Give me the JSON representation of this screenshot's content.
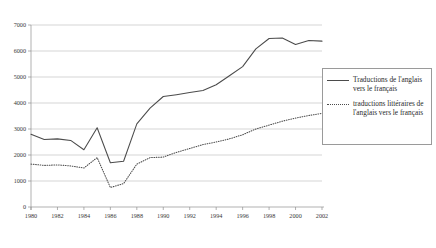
{
  "chart_data": {
    "type": "line",
    "title": "",
    "subtitle": "",
    "xlabel": "",
    "ylabel": "",
    "xlim": [
      1980,
      2002
    ],
    "ylim": [
      0,
      7000
    ],
    "grid": true,
    "legend_position": "right",
    "y_ticks": [
      0,
      1000,
      2000,
      3000,
      4000,
      5000,
      6000,
      7000
    ],
    "y_tick_labels": [
      "0",
      "1000",
      "2000",
      "3000",
      "4000",
      "5000",
      "6000",
      "7000"
    ],
    "x_ticks": [
      1980,
      1982,
      1984,
      1986,
      1988,
      1990,
      1992,
      1994,
      1996,
      1998,
      2000,
      2002
    ],
    "x_tick_labels": [
      "1980",
      "1982",
      "1984",
      "1986",
      "1988",
      "1990",
      "1992",
      "1994",
      "1996",
      "1998",
      "2000",
      "2002"
    ],
    "x": [
      1980,
      1981,
      1982,
      1983,
      1984,
      1985,
      1986,
      1987,
      1988,
      1989,
      1990,
      1991,
      1992,
      1993,
      1994,
      1995,
      1996,
      1997,
      1998,
      1999,
      2000,
      2001,
      2002
    ],
    "series": [
      {
        "name": "Traductions de l'anglais vers le français",
        "style": "solid",
        "color": "#4b4b4b",
        "values": [
          2800,
          2600,
          2620,
          2560,
          2200,
          3050,
          1700,
          1760,
          3200,
          3800,
          4250,
          4320,
          4400,
          4480,
          4700,
          5050,
          5400,
          6080,
          6480,
          6500,
          6250,
          6400,
          6380
        ]
      },
      {
        "name": "traductions littéraires de l'anglais vers le français",
        "style": "dotted",
        "color": "#4b4b4b",
        "values": [
          1650,
          1600,
          1620,
          1580,
          1500,
          1900,
          750,
          900,
          1650,
          1900,
          1920,
          2100,
          2250,
          2400,
          2500,
          2620,
          2780,
          3000,
          3150,
          3300,
          3420,
          3520,
          3600
        ]
      }
    ]
  },
  "legend": {
    "entries": [
      {
        "label": "Traductions de l'anglais vers le français",
        "style": "solid"
      },
      {
        "label": "traductions littéraires de l'anglais vers le français",
        "style": "dotted"
      }
    ]
  }
}
